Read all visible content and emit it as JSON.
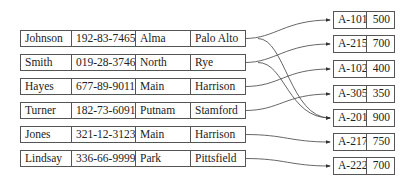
{
  "customers": [
    {
      "name": "Johnson",
      "ssn": "192-83-7465",
      "street": "Alma",
      "city": "Palo Alto"
    },
    {
      "name": "Smith",
      "ssn": "019-28-3746",
      "street": "North",
      "city": "Rye"
    },
    {
      "name": "Hayes",
      "ssn": "677-89-9011",
      "street": "Main",
      "city": "Harrison"
    },
    {
      "name": "Turner",
      "ssn": "182-73-6091",
      "street": "Putnam",
      "city": "Stamford"
    },
    {
      "name": "Jones",
      "ssn": "321-12-3123",
      "street": "Main",
      "city": "Harrison"
    },
    {
      "name": "Lindsay",
      "ssn": "336-66-9999",
      "street": "Park",
      "city": "Pittsfield"
    }
  ],
  "accounts": [
    {
      "number": "A-101",
      "balance": "500"
    },
    {
      "number": "A-215",
      "balance": "700"
    },
    {
      "number": "A-102",
      "balance": "400"
    },
    {
      "number": "A-305",
      "balance": "350"
    },
    {
      "number": "A-201",
      "balance": "900"
    },
    {
      "number": "A-217",
      "balance": "750"
    },
    {
      "number": "A-222",
      "balance": "700"
    }
  ],
  "links": [
    {
      "from": "Johnson",
      "to": "A-101"
    },
    {
      "from": "Johnson",
      "to": "A-201"
    },
    {
      "from": "Smith",
      "to": "A-215"
    },
    {
      "from": "Smith",
      "to": "A-201"
    },
    {
      "from": "Hayes",
      "to": "A-102"
    },
    {
      "from": "Turner",
      "to": "A-305"
    },
    {
      "from": "Jones",
      "to": "A-217"
    },
    {
      "from": "Lindsay",
      "to": "A-222"
    }
  ]
}
